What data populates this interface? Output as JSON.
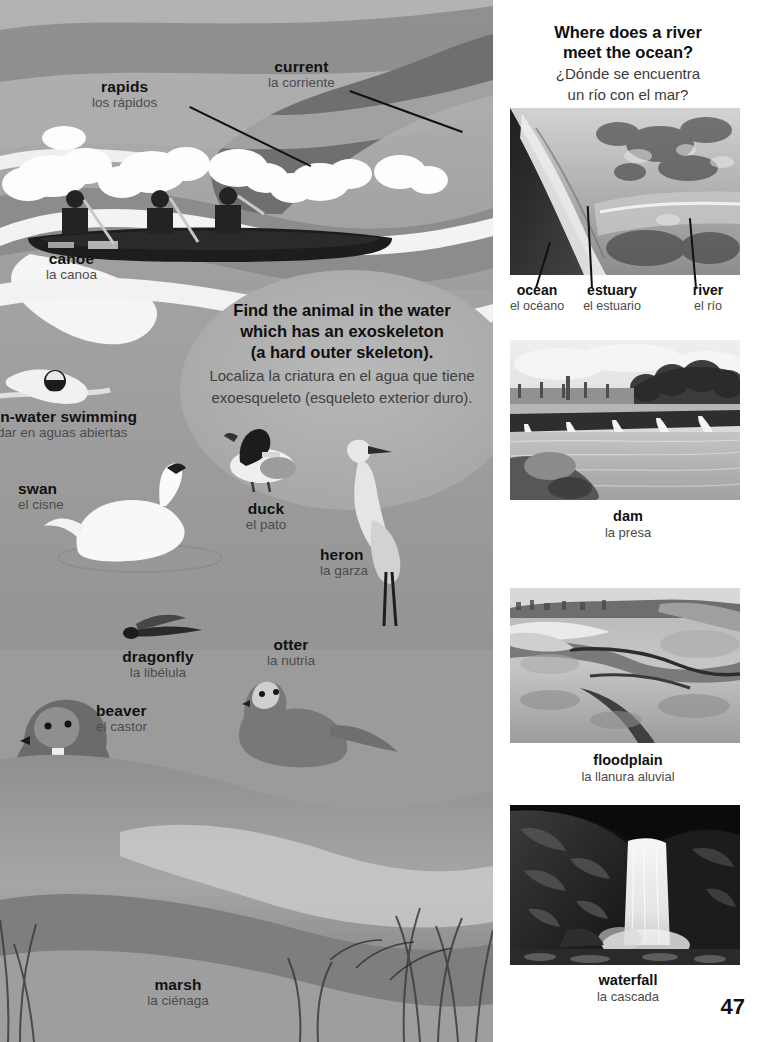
{
  "page": {
    "number": "47",
    "background": "#ffffff",
    "illustration_bg": "#9b9b9b",
    "ink": "#111111",
    "ink_secondary": "#4a4a4a"
  },
  "illustration": {
    "riddle": {
      "en_line1": "Find the animal in the water",
      "en_line2": "which has an exoskeleton",
      "en_line3": "(a hard outer skeleton).",
      "es_line1": "Localiza la criatura en el agua que tiene",
      "es_line2": "exoesqueleto (esqueleto exterior duro)."
    },
    "labels": [
      {
        "en": "rapids",
        "es": "los rápidos"
      },
      {
        "en": "current",
        "es": "la corriente"
      },
      {
        "en": "canoe",
        "es": "la canoa"
      },
      {
        "en": "pen-water swimming",
        "es": "nadar en aguas abiertas"
      },
      {
        "en": "swan",
        "es": "el cisne"
      },
      {
        "en": "duck",
        "es": "el pato"
      },
      {
        "en": "heron",
        "es": "la garza"
      },
      {
        "en": "dragonfly",
        "es": "la libélula"
      },
      {
        "en": "otter",
        "es": "la nutria"
      },
      {
        "en": "beaver",
        "es": "el castor"
      },
      {
        "en": "marsh",
        "es": "la ciénaga"
      }
    ]
  },
  "right_column": {
    "heading": {
      "en_line1": "Where does a river",
      "en_line2": "meet the ocean?",
      "es_line1": "¿Dónde se encuentra",
      "es_line2": "un río con el mar?"
    },
    "estuary_labels": [
      {
        "en": "ocean",
        "es": "el océano"
      },
      {
        "en": "estuary",
        "es": "el estuario"
      },
      {
        "en": "river",
        "es": "el río"
      }
    ],
    "photos": [
      {
        "name": "estuary-aerial-photo",
        "caption_en": "",
        "caption_es": ""
      },
      {
        "name": "dam-photo",
        "caption_en": "dam",
        "caption_es": "la presa"
      },
      {
        "name": "floodplain-photo",
        "caption_en": "floodplain",
        "caption_es": "la llanura aluvial"
      },
      {
        "name": "waterfall-photo",
        "caption_en": "waterfall",
        "caption_es": "la cascada"
      }
    ]
  }
}
